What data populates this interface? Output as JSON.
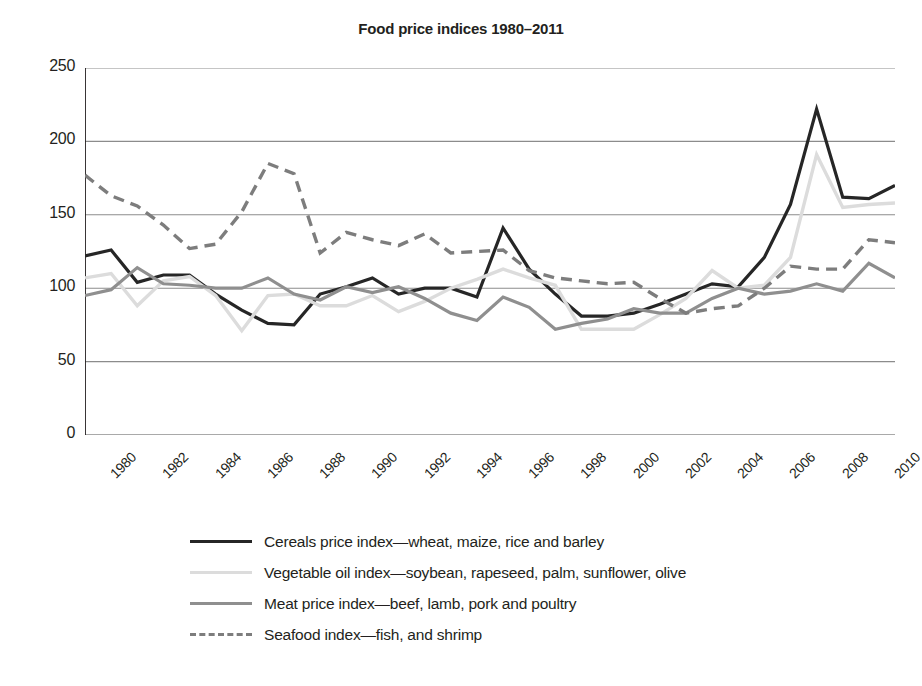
{
  "chart_data": {
    "type": "line",
    "title": "Food price indices 1980–2011",
    "xlabel": "",
    "ylabel": "",
    "xlim": [
      1980,
      2011
    ],
    "ylim": [
      0,
      250
    ],
    "yticks": [
      "0",
      "50",
      "100",
      "150",
      "200",
      "250"
    ],
    "ytick_values": [
      0,
      50,
      100,
      150,
      200,
      250
    ],
    "grid": true,
    "legend_position": "bottom",
    "x": [
      1980,
      1981,
      1982,
      1983,
      1984,
      1985,
      1986,
      1987,
      1988,
      1989,
      1990,
      1991,
      1992,
      1993,
      1994,
      1995,
      1996,
      1997,
      1998,
      1999,
      2000,
      2001,
      2002,
      2003,
      2004,
      2005,
      2006,
      2007,
      2008,
      2009,
      2010,
      2011
    ],
    "xtick_labels": [
      "1980",
      "1982",
      "1984",
      "1986",
      "1988",
      "1990",
      "1992",
      "1994",
      "1996",
      "1998",
      "2000",
      "2002",
      "2004",
      "2006",
      "2008",
      "2010"
    ],
    "xtick_values": [
      1980,
      1982,
      1984,
      1986,
      1988,
      1990,
      1992,
      1994,
      1996,
      1998,
      2000,
      2002,
      2004,
      2006,
      2008,
      2010
    ],
    "series": [
      {
        "name": "cereals",
        "label": "Cereals price index—wheat, maize, rice and barley",
        "color": "#262626",
        "width": 3.2,
        "dash": "none",
        "values": [
          122,
          126,
          104,
          109,
          109,
          96,
          85,
          76,
          75,
          96,
          101,
          107,
          96,
          100,
          100,
          94,
          141,
          113,
          96,
          81,
          81,
          83,
          89,
          96,
          103,
          101,
          121,
          157,
          222,
          162,
          161,
          170
        ]
      },
      {
        "name": "vegetable_oil",
        "label": "Vegetable oil index—soybean, rapeseed, palm, sunflower, olive",
        "color": "#dcdcdc",
        "width": 3.4,
        "dash": "none",
        "values": [
          107,
          110,
          88,
          105,
          108,
          95,
          71,
          95,
          96,
          88,
          88,
          95,
          84,
          91,
          100,
          106,
          113,
          107,
          102,
          72,
          72,
          72,
          82,
          93,
          112,
          100,
          102,
          121,
          191,
          155,
          157,
          158
        ]
      },
      {
        "name": "meat",
        "label": "Meat price index—beef, lamb, pork and poultry",
        "color": "#8f8f8f",
        "width": 3.2,
        "dash": "none",
        "values": [
          95,
          99,
          114,
          103,
          102,
          100,
          100,
          107,
          96,
          92,
          101,
          97,
          101,
          93,
          83,
          78,
          94,
          87,
          72,
          76,
          79,
          86,
          83,
          83,
          93,
          100,
          96,
          98,
          103,
          98,
          117,
          107
        ]
      },
      {
        "name": "seafood",
        "label": "Seafood index—fish, and shrimp",
        "color": "#7d7d7d",
        "width": 3.4,
        "dash": "11 7",
        "values": [
          177,
          163,
          156,
          143,
          127,
          130,
          152,
          185,
          178,
          124,
          138,
          133,
          129,
          137,
          124,
          125,
          126,
          112,
          107,
          105,
          103,
          104,
          93,
          83,
          86,
          88,
          100,
          115,
          113,
          113,
          133,
          131
        ]
      }
    ]
  },
  "legend": {
    "items": [
      {
        "name": "cereals",
        "label": "Cereals price index—wheat, maize, rice and barley"
      },
      {
        "name": "vegetable-oil",
        "label": "Vegetable oil index—soybean, rapeseed, palm, sunflower, olive"
      },
      {
        "name": "meat",
        "label": "Meat price index—beef, lamb, pork and poultry"
      },
      {
        "name": "seafood",
        "label": "Seafood index—fish, and shrimp"
      }
    ]
  },
  "colors": {
    "axis": "#231f20",
    "grid": "#8c8c8c",
    "background": "#ffffff",
    "cereals": "#262626",
    "vegetable_oil": "#dcdcdc",
    "meat": "#8f8f8f",
    "seafood": "#7d7d7d"
  }
}
